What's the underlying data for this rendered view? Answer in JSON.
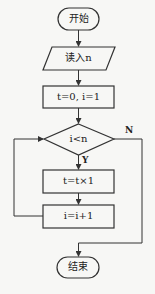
{
  "flowchart": {
    "start": {
      "label": "开始"
    },
    "input": {
      "label": "读入n"
    },
    "init": {
      "label": "t=0, i=1"
    },
    "condition": {
      "label": "i<n"
    },
    "multiply": {
      "label": "t=t×1"
    },
    "increment": {
      "label": "i=i+1"
    },
    "end": {
      "label": "结束"
    },
    "branch_yes": {
      "label": "Y"
    },
    "branch_no": {
      "label": "N"
    }
  },
  "colors": {
    "stroke": "#333333",
    "background": "#f7f7f5",
    "text": "#222222"
  }
}
